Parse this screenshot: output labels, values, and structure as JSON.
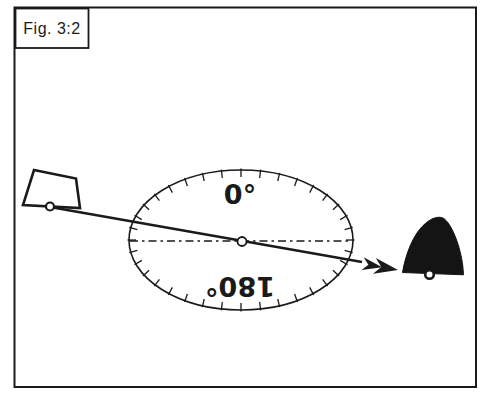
{
  "figure": {
    "label": "Fig. 3:2"
  },
  "dial": {
    "top_label": "0°",
    "bottom_label": "180°",
    "bottom_label_rotated_deg": 180,
    "tick_count": 36,
    "tick_length_px": 7,
    "center": {
      "cx": 241,
      "cy": 240,
      "rx": 112,
      "ry": 70
    }
  },
  "colors": {
    "ink": "#1a1a1a",
    "paper": "#ffffff",
    "target_fill": "#141414"
  }
}
